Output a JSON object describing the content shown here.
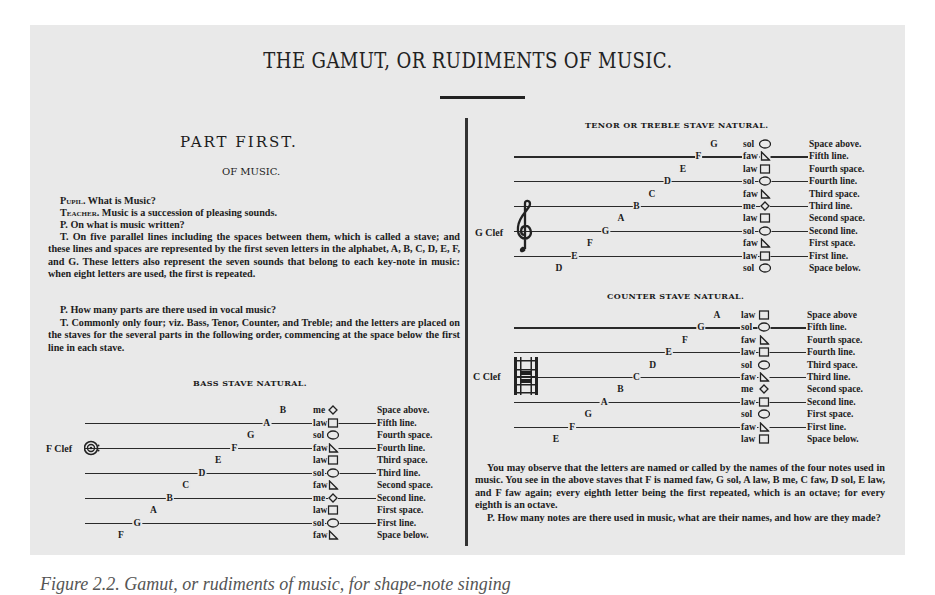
{
  "document": {
    "title": "THE GAMUT, OR RUDIMENTS OF MUSIC.",
    "caption": "Figure 2.2. Gamut, or rudiments of music, for shape-note singing"
  },
  "left_column": {
    "part_title": "PART FIRST.",
    "section_title": "OF MUSIC.",
    "paragraphs": [
      {
        "speaker": "Pupil.",
        "text": " What is Music?"
      },
      {
        "speaker": "Teacher.",
        "text": " Music is a succession of pleasing sounds."
      },
      {
        "speaker": "P.",
        "text": " On what is music written?"
      },
      {
        "speaker": "T.",
        "text": " On five parallel lines including the spaces between them, which is called a stave; and these lines and spaces are represented by the first seven letters in the alphabet, A, B, C, D, E, F, and G.  These letters also represent the seven sounds that belong to each key-note in music: when eight letters are used, the first is repeated."
      },
      {
        "speaker": "P.",
        "text": " How many parts are there used in vocal music?"
      },
      {
        "speaker": "T.",
        "text": " Commonly only four; viz. Bass, Tenor, Counter, and Treble; and the letters are placed on the staves for the several parts in the following order, commencing at the space below the first line in each stave."
      }
    ]
  },
  "bass_stave": {
    "title": "BASS STAVE NATURAL.",
    "clef_label": "F Clef",
    "rows": [
      {
        "letter": "B",
        "syllable": "me",
        "shape": "diamond",
        "position": "Space above."
      },
      {
        "letter": "A",
        "syllable": "law",
        "shape": "square",
        "position": "Fifth line."
      },
      {
        "letter": "G",
        "syllable": "sol",
        "shape": "oval",
        "position": "Fourth space."
      },
      {
        "letter": "F",
        "syllable": "faw",
        "shape": "triangle",
        "position": "Fourth line."
      },
      {
        "letter": "E",
        "syllable": "law",
        "shape": "square",
        "position": "Third space."
      },
      {
        "letter": "D",
        "syllable": "sol",
        "shape": "oval",
        "position": "Third line."
      },
      {
        "letter": "C",
        "syllable": "faw",
        "shape": "triangle",
        "position": "Second space."
      },
      {
        "letter": "B",
        "syllable": "me",
        "shape": "diamond",
        "position": "Second line."
      },
      {
        "letter": "A",
        "syllable": "law",
        "shape": "square",
        "position": "First space."
      },
      {
        "letter": "G",
        "syllable": "sol",
        "shape": "oval",
        "position": "First line."
      },
      {
        "letter": "F",
        "syllable": "faw",
        "shape": "triangle",
        "position": "Space below."
      }
    ]
  },
  "tenor_stave": {
    "title": "TENOR OR TREBLE STAVE NATURAL.",
    "clef_label": "G Clef",
    "rows": [
      {
        "letter": "G",
        "syllable": "sol",
        "shape": "oval",
        "position": "Space above."
      },
      {
        "letter": "F",
        "syllable": "faw",
        "shape": "triangle",
        "position": "Fifth line."
      },
      {
        "letter": "E",
        "syllable": "law",
        "shape": "square",
        "position": "Fourth space."
      },
      {
        "letter": "D",
        "syllable": "sol",
        "shape": "oval",
        "position": "Fourth line."
      },
      {
        "letter": "C",
        "syllable": "faw",
        "shape": "triangle",
        "position": "Third space."
      },
      {
        "letter": "B",
        "syllable": "me",
        "shape": "diamond",
        "position": "Third line."
      },
      {
        "letter": "A",
        "syllable": "law",
        "shape": "square",
        "position": "Second space."
      },
      {
        "letter": "G",
        "syllable": "sol",
        "shape": "oval",
        "position": "Second line."
      },
      {
        "letter": "F",
        "syllable": "faw",
        "shape": "triangle",
        "position": "First space."
      },
      {
        "letter": "E",
        "syllable": "law",
        "shape": "square",
        "position": "First line."
      },
      {
        "letter": "D",
        "syllable": "sol",
        "shape": "oval",
        "position": "Space below."
      }
    ]
  },
  "counter_stave": {
    "title": "COUNTER STAVE NATURAL.",
    "clef_label": "C Clef",
    "rows": [
      {
        "letter": "A",
        "syllable": "law",
        "shape": "square",
        "position": "Space above"
      },
      {
        "letter": "G",
        "syllable": "sol",
        "shape": "oval",
        "position": "Fifth line."
      },
      {
        "letter": "F",
        "syllable": "faw",
        "shape": "triangle",
        "position": "Fourth space."
      },
      {
        "letter": "E",
        "syllable": "law",
        "shape": "square",
        "position": "Fourth line."
      },
      {
        "letter": "D",
        "syllable": "sol",
        "shape": "oval",
        "position": "Third space."
      },
      {
        "letter": "C",
        "syllable": "faw",
        "shape": "triangle",
        "position": "Third line."
      },
      {
        "letter": "B",
        "syllable": "me",
        "shape": "diamond",
        "position": "Second space."
      },
      {
        "letter": "A",
        "syllable": "law",
        "shape": "square",
        "position": "Second line."
      },
      {
        "letter": "G",
        "syllable": "sol",
        "shape": "oval",
        "position": "First space."
      },
      {
        "letter": "F",
        "syllable": "faw",
        "shape": "triangle",
        "position": "First line."
      },
      {
        "letter": "E",
        "syllable": "law",
        "shape": "square",
        "position": "Space below."
      }
    ]
  },
  "right_column": {
    "paragraphs": [
      {
        "speaker": "",
        "text": "You may observe that the letters are named or called by the names of the four notes used in music.  You see in the above staves that F is named faw, G sol, A law, B me, C faw, D sol, E law, and F faw again; every eighth letter being the first repeated, which is an octave; for every eighth is an octave."
      },
      {
        "speaker": "P.",
        "text": " How many notes are there used in music, what are their names, and how are they made?"
      }
    ]
  }
}
